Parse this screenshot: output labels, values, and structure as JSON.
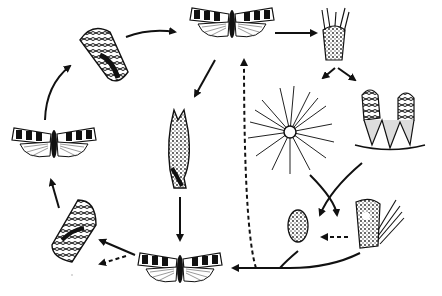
{
  "diagram": {
    "type": "life-cycle",
    "colors": {
      "ink": "#111111",
      "background": "#ffffff"
    },
    "nodes": [
      {
        "id": "moth-top",
        "kind": "moth",
        "x": 232,
        "y": 18
      },
      {
        "id": "cone-topleft",
        "kind": "pine-cone",
        "x": 103,
        "y": 55
      },
      {
        "id": "moth-left",
        "kind": "moth",
        "x": 54,
        "y": 138
      },
      {
        "id": "cone-bottomleft",
        "kind": "pine-cone",
        "x": 73,
        "y": 228
      },
      {
        "id": "moth-bottom",
        "kind": "moth",
        "x": 180,
        "y": 265
      },
      {
        "id": "bud-center",
        "kind": "infested-shoot",
        "x": 179,
        "y": 140
      },
      {
        "id": "shoot-topright",
        "kind": "shoot-tip",
        "x": 334,
        "y": 35
      },
      {
        "id": "pine-needles",
        "kind": "needle-cluster",
        "x": 290,
        "y": 130
      },
      {
        "id": "cones-right",
        "kind": "young-cones",
        "x": 392,
        "y": 120
      },
      {
        "id": "cone-small",
        "kind": "small-cone",
        "x": 300,
        "y": 225
      },
      {
        "id": "shoot-damaged",
        "kind": "damaged-shoot",
        "x": 373,
        "y": 225
      }
    ],
    "arrows": [
      {
        "from": "cone-topleft",
        "to": "moth-top",
        "style": "solid"
      },
      {
        "from": "moth-top",
        "to": "shoot-topright",
        "style": "solid"
      },
      {
        "from": "moth-top",
        "to": "bud-center",
        "style": "solid"
      },
      {
        "from": "bud-center",
        "to": "moth-bottom",
        "style": "solid"
      },
      {
        "from": "moth-left",
        "to": "cone-topleft",
        "style": "solid"
      },
      {
        "from": "cone-bottomleft",
        "to": "moth-left",
        "style": "solid"
      },
      {
        "from": "moth-bottom",
        "to": "cone-bottomleft",
        "style": "solid"
      },
      {
        "from": "moth-bottom",
        "to": "off-left",
        "style": "dashed"
      },
      {
        "from": "shoot-topright",
        "to": "pine-needles",
        "style": "solid"
      },
      {
        "from": "shoot-topright",
        "to": "cones-right",
        "style": "solid"
      },
      {
        "from": "pine-needles",
        "to": "shoot-damaged",
        "style": "solid"
      },
      {
        "from": "cones-right",
        "to": "cone-small",
        "style": "solid"
      },
      {
        "from": "shoot-damaged",
        "to": "cone-small",
        "style": "dashed"
      },
      {
        "from": "cone-small",
        "to": "moth-bottom",
        "style": "solid"
      },
      {
        "from": "shoot-damaged",
        "to": "moth-bottom",
        "style": "solid"
      },
      {
        "from": "baseline",
        "to": "moth-top",
        "style": "dashed"
      }
    ]
  }
}
